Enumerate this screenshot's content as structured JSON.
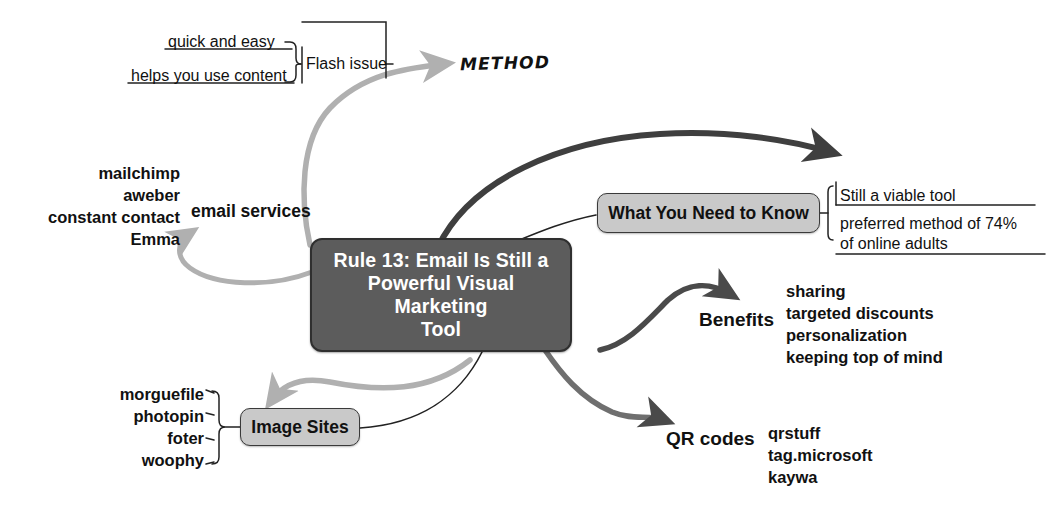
{
  "diagram": {
    "title": "Rule 13: Email Is Still a Powerful Visual Marketing Tool",
    "type": "mind-map",
    "colors": {
      "center_fill": "#5c5c5c",
      "center_text": "#ffffff",
      "node_fill": "#c9c9c9",
      "node_text": "#111111",
      "light_arrow": "#b0b0b0",
      "dark_arrow": "#4a4a4a",
      "thin_line": "#222222",
      "background": "#ffffff"
    }
  },
  "center": {
    "label": "Rule 13: Email Is Still a\nPowerful Visual Marketing\nTool",
    "line1": "Rule 13: Email Is Still a",
    "line2": "Powerful Visual Marketing",
    "line3": "Tool"
  },
  "method_branch": {
    "label": "METHOD",
    "flash_issue": "Flash issue",
    "items": [
      "quick and easy",
      "helps you use content"
    ]
  },
  "email_services": {
    "label": "email services",
    "items": [
      "mailchimp",
      "aweber",
      "constant contact",
      "Emma"
    ]
  },
  "what_you_need_to_know": {
    "label": "What You Need to Know",
    "items": [
      "Still a viable tool",
      "preferred  method  of  74%\nof online adults"
    ],
    "item1": "Still a viable tool",
    "item2_line1": "preferred  method  of  74%",
    "item2_line2": "of online adults"
  },
  "benefits": {
    "label": "Benefits",
    "items": [
      "sharing",
      "targeted discounts",
      "personalization",
      "keeping top of mind"
    ]
  },
  "qr_codes": {
    "label": "QR codes",
    "items": [
      "qrstuff",
      "tag.microsoft",
      "kaywa"
    ]
  },
  "image_sites": {
    "label": "Image Sites",
    "items": [
      "morguefile",
      "photopin",
      "foter",
      "woophy"
    ]
  }
}
